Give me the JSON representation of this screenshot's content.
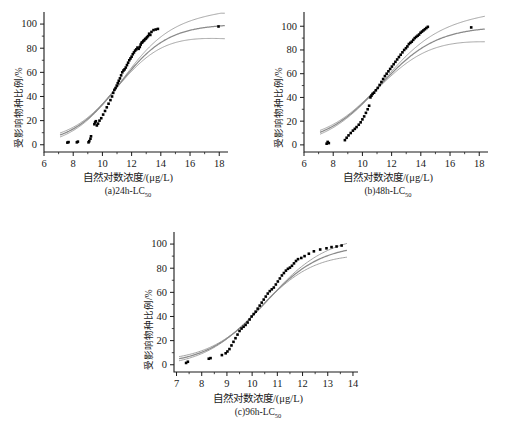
{
  "figure": {
    "background": "#ffffff",
    "marker_color": "#000000",
    "fit_color": "#8a8a8a",
    "axis_color": "#1a1a1a"
  },
  "common": {
    "ylabel": "受影响物种比例/%",
    "xlabel": "自然对数浓度/(μg/L)",
    "yticks": [
      "0",
      "20",
      "40",
      "60",
      "80",
      "100"
    ]
  },
  "panels": [
    {
      "id": "a",
      "caption_main": "(a)24h-LC",
      "caption_sub": "50",
      "xticks": [
        "6",
        "8",
        "10",
        "12",
        "14",
        "16",
        "18"
      ],
      "xlabel": "自然对数浓度/(μg/L)",
      "ylabel": "受影响物种比例/%"
    },
    {
      "id": "b",
      "caption_main": "(b)48h-LC",
      "caption_sub": "50",
      "xticks": [
        "6",
        "8",
        "10",
        "12",
        "14",
        "16",
        "18"
      ],
      "xlabel": "自然对数浓度/(μg/L)",
      "ylabel": "受影响物种比例/%"
    },
    {
      "id": "c",
      "caption_main": "(c)96h-LC",
      "caption_sub": "50",
      "xticks": [
        "7",
        "8",
        "9",
        "10",
        "11",
        "12",
        "13",
        "14"
      ],
      "xlabel": "自然对数浓度/(μg/L)",
      "ylabel": "受影响物种比例/%"
    }
  ],
  "chart_data": [
    {
      "type": "scatter",
      "title": "(a)24h-LC50",
      "xlabel": "自然对数浓度/(μg/L)",
      "ylabel": "受影响物种比例/%",
      "xlim": [
        6,
        18.6
      ],
      "ylim": [
        -6,
        110
      ],
      "grid": false,
      "legend": "none",
      "series": [
        {
          "name": "observed species sensitivity",
          "marker": "filled-square",
          "x": [
            7.6,
            7.68,
            8.25,
            8.32,
            9.05,
            9.1,
            9.18,
            9.22,
            9.45,
            9.5,
            9.55,
            9.62,
            9.7,
            9.8,
            9.92,
            10.05,
            10.18,
            10.3,
            10.42,
            10.55,
            10.66,
            10.74,
            10.82,
            10.9,
            10.98,
            11.05,
            11.12,
            11.2,
            11.28,
            11.36,
            11.44,
            11.52,
            11.6,
            11.68,
            11.76,
            11.84,
            11.92,
            12.0,
            12.08,
            12.16,
            12.24,
            12.32,
            12.4,
            12.48,
            12.56,
            12.62,
            12.68,
            12.74,
            12.8,
            12.86,
            12.92,
            12.98,
            13.05,
            13.12,
            13.2,
            13.28,
            13.36,
            13.5,
            13.65,
            13.8,
            17.95
          ],
          "y": [
            1.8,
            2.2,
            2.0,
            2.6,
            2.0,
            3.0,
            5.0,
            7.0,
            17.0,
            18.5,
            19.5,
            16.0,
            17.5,
            20.0,
            22.0,
            25.0,
            28.0,
            31.0,
            34.0,
            37.0,
            40.0,
            43.0,
            45.5,
            47.0,
            49.0,
            51.0,
            53.0,
            55.0,
            57.5,
            60.0,
            61.5,
            62.5,
            64.0,
            66.0,
            68.0,
            70.0,
            71.5,
            73.0,
            75.0,
            76.5,
            78.0,
            79.0,
            80.5,
            79.5,
            81.0,
            83.0,
            84.5,
            85.0,
            86.0,
            86.5,
            87.5,
            88.0,
            89.0,
            90.0,
            92.0,
            91.0,
            93.5,
            95.0,
            95.5,
            96.0,
            98.0
          ]
        },
        {
          "name": "fitted log-logistic curve",
          "type": "line",
          "color": "#8a8a8a",
          "note": "sigmoid fit through data, EC50 approx 11.1"
        },
        {
          "name": "95% confidence band (upper/lower)",
          "type": "line",
          "color": "#9a9a9a"
        }
      ]
    },
    {
      "type": "scatter",
      "title": "(b)48h-LC50",
      "xlabel": "自然对数浓度/(μg/L)",
      "ylabel": "受影响物种比例/%",
      "xlim": [
        6,
        18.6
      ],
      "ylim": [
        -6,
        112
      ],
      "grid": false,
      "legend": "none",
      "series": [
        {
          "name": "observed species sensitivity",
          "marker": "filled-square",
          "x": [
            7.55,
            7.62,
            7.7,
            8.8,
            8.92,
            9.05,
            9.2,
            9.35,
            9.48,
            9.6,
            9.75,
            9.88,
            10.0,
            10.12,
            10.24,
            10.36,
            10.46,
            10.55,
            10.62,
            10.7,
            10.8,
            10.92,
            11.05,
            11.18,
            11.3,
            11.42,
            11.54,
            11.66,
            11.78,
            11.9,
            12.02,
            12.14,
            12.26,
            12.38,
            12.5,
            12.62,
            12.74,
            12.86,
            12.98,
            13.08,
            13.18,
            13.28,
            13.38,
            13.48,
            13.58,
            13.68,
            13.78,
            13.88,
            13.98,
            14.08,
            14.18,
            14.28,
            14.38,
            14.48,
            17.45
          ],
          "y": [
            1.0,
            2.5,
            1.5,
            4.0,
            6.0,
            8.0,
            10.0,
            12.0,
            13.5,
            15.0,
            17.0,
            19.0,
            21.5,
            24.0,
            27.0,
            30.0,
            33.0,
            40.0,
            41.5,
            43.0,
            44.0,
            46.0,
            48.0,
            50.5,
            53.0,
            55.5,
            58.0,
            60.0,
            62.0,
            64.0,
            66.0,
            68.0,
            70.0,
            72.0,
            74.0,
            76.0,
            78.0,
            80.0,
            81.5,
            83.0,
            85.0,
            86.0,
            87.0,
            88.5,
            90.0,
            91.0,
            92.0,
            93.0,
            94.5,
            95.5,
            96.5,
            97.5,
            98.5,
            99.5,
            99.0
          ]
        },
        {
          "name": "fitted log-logistic curve",
          "type": "line",
          "color": "#8a8a8a",
          "note": "sigmoid fit through data, EC50 approx 11.15"
        },
        {
          "name": "95% confidence band (upper/lower)",
          "type": "line",
          "color": "#9a9a9a"
        }
      ]
    },
    {
      "type": "scatter",
      "title": "(c)96h-LC50",
      "xlabel": "自然对数浓度/(μg/L)",
      "ylabel": "受影响物种比例/%",
      "xlim": [
        6.9,
        14.2
      ],
      "ylim": [
        -6,
        110
      ],
      "grid": false,
      "legend": "none",
      "series": [
        {
          "name": "observed species sensitivity",
          "marker": "filled-square",
          "x": [
            7.38,
            7.45,
            8.28,
            8.35,
            8.8,
            8.95,
            9.02,
            9.1,
            9.18,
            9.26,
            9.34,
            9.42,
            9.5,
            9.58,
            9.66,
            9.74,
            9.82,
            9.9,
            9.98,
            10.06,
            10.14,
            10.22,
            10.3,
            10.38,
            10.46,
            10.54,
            10.62,
            10.7,
            10.78,
            10.86,
            10.94,
            11.02,
            11.1,
            11.18,
            11.26,
            11.34,
            11.42,
            11.5,
            11.58,
            11.66,
            11.74,
            11.82,
            11.95,
            12.08,
            12.25,
            12.45,
            12.7,
            12.95,
            13.15,
            13.35,
            13.55
          ],
          "y": [
            1.5,
            2.5,
            5.0,
            5.5,
            8.0,
            9.5,
            11.0,
            13.0,
            16.0,
            19.0,
            22.0,
            25.0,
            28.0,
            30.0,
            31.5,
            33.0,
            35.0,
            37.5,
            40.0,
            42.0,
            44.0,
            46.5,
            49.0,
            51.5,
            54.0,
            56.5,
            59.0,
            61.0,
            62.5,
            64.0,
            66.5,
            69.0,
            71.5,
            74.0,
            76.0,
            78.0,
            79.5,
            80.5,
            82.0,
            84.0,
            86.0,
            87.5,
            88.5,
            90.0,
            92.0,
            94.0,
            95.5,
            96.5,
            97.5,
            98.0,
            98.8
          ]
        },
        {
          "name": "fitted log-logistic curve",
          "type": "line",
          "color": "#8a8a8a",
          "note": "sigmoid fit through data, EC50 approx 10.45"
        },
        {
          "name": "95% confidence band (upper/lower)",
          "type": "line",
          "color": "#9a9a9a"
        }
      ]
    }
  ]
}
